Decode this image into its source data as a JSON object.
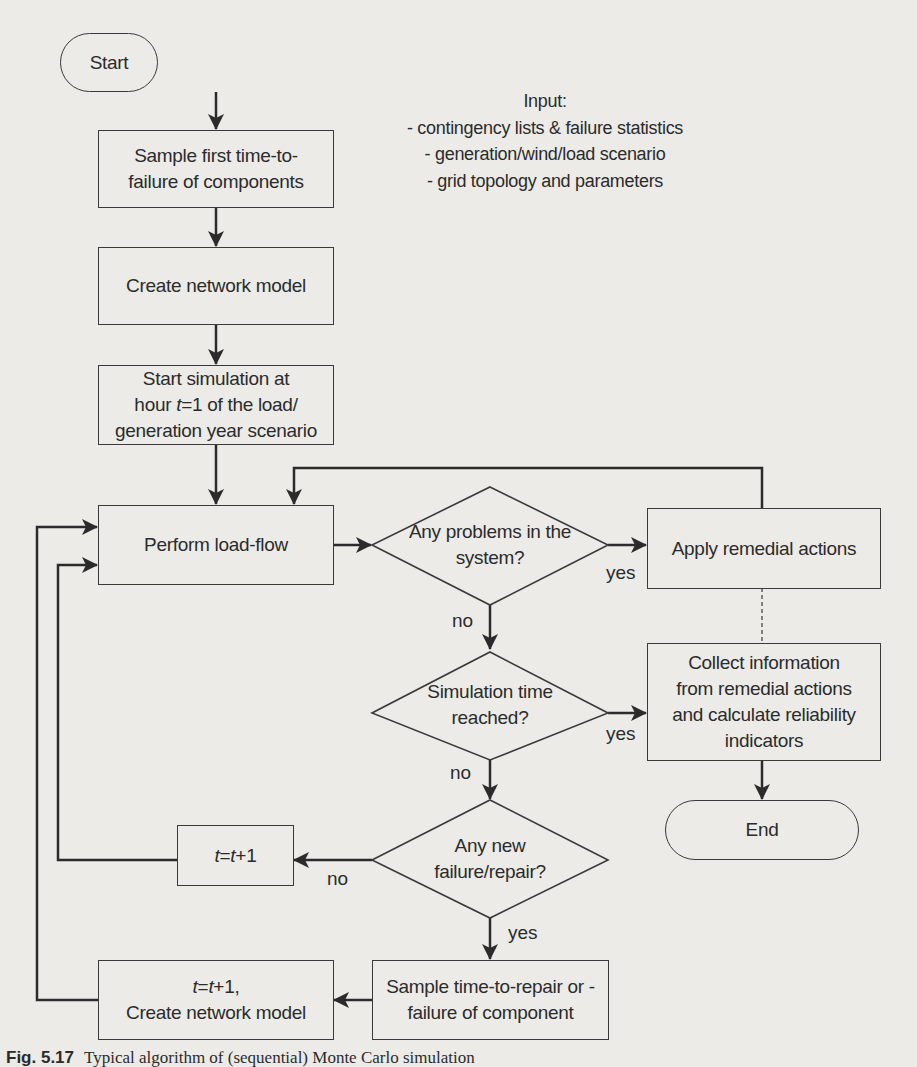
{
  "nodes": {
    "start": "Start",
    "sample_first": "Sample first time-to-failure of components",
    "create_network": "Create network model",
    "start_sim_line1": "Start simulation at",
    "start_sim_line2_pre": "hour ",
    "start_sim_line2_var": "t",
    "start_sim_line2_post": "=1 of the load/",
    "start_sim_line3": "generation year scenario",
    "load_flow": "Perform load-flow",
    "apply_remedial": "Apply remedial actions",
    "collect_info": "Collect information from remedial actions and calculate reliability indicators",
    "end": "End",
    "t_increment_var1": "t",
    "t_increment_eq": "=",
    "t_increment_var2": "t",
    "t_increment_post": "+1",
    "sample_repair": "Sample time-to-repair or -failure of component",
    "t_create_var1": "t",
    "t_create_eq": "=",
    "t_create_var2": "t",
    "t_create_post": "+1,",
    "t_create_line2": "Create network model"
  },
  "decisions": {
    "problems": "Any problems in the system?",
    "time_reached": "Simulation time reached?",
    "new_failure": "Any new failure/repair?"
  },
  "edge_labels": {
    "problems_yes": "yes",
    "problems_no": "no",
    "time_yes": "yes",
    "time_no": "no",
    "failure_no": "no",
    "failure_yes": "yes"
  },
  "input_note": {
    "title": "Input:",
    "items": [
      "- contingency lists & failure statistics",
      "- generation/wind/load scenario",
      "- grid topology and parameters"
    ]
  },
  "caption": {
    "number": "Fig. 5.17",
    "text": "Typical algorithm of (sequential) Monte Carlo simulation"
  },
  "colors": {
    "background": "#ecebe8",
    "stroke": "#2b2b2b"
  }
}
